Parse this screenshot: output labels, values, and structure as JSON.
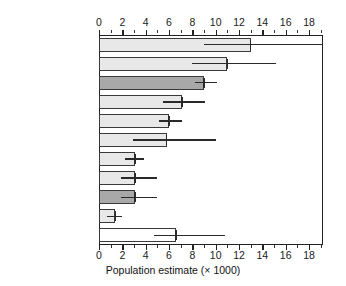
{
  "chart_data": {
    "type": "bar",
    "orientation": "horizontal",
    "title": "",
    "xlabel": "Population estimate (× 1000)",
    "ylabel": "",
    "xlim": [
      0,
      19.2
    ],
    "xticks": [
      0,
      2,
      4,
      6,
      8,
      10,
      12,
      14,
      16,
      18
    ],
    "xtick_labels": [
      "0",
      "2",
      "4",
      "6",
      "8",
      "10",
      "12",
      "14",
      "16",
      "18"
    ],
    "minor_tick_step": 1,
    "grid": false,
    "legend": null,
    "axis_top_duplicated": true,
    "categories": [
      "GERMANY",
      "POLAND",
      "CROATIA",
      "BELARUS",
      "HUNGARY",
      "ROMANIA",
      "SLOVAKIA",
      "GREECE",
      "ALBANIA",
      "CZECH REPUBLIC",
      "Other countries"
    ],
    "values": [
      13.0,
      11.0,
      9.0,
      7.1,
      6.0,
      5.8,
      3.1,
      3.1,
      3.1,
      1.4,
      6.6
    ],
    "error_low": [
      9.0,
      8.0,
      8.2,
      5.5,
      5.1,
      2.9,
      2.2,
      1.9,
      1.9,
      0.7,
      4.7
    ],
    "error_high": [
      19.2,
      15.2,
      10.1,
      9.1,
      7.1,
      10.0,
      3.9,
      5.0,
      5.0,
      2.0,
      10.8
    ],
    "error_high_clipped": [
      true,
      false,
      false,
      false,
      false,
      false,
      false,
      false,
      false,
      false,
      false
    ],
    "bar_fills": [
      "#e8e8e8",
      "#e8e8e8",
      "#a8a8a8",
      "#e8e8e8",
      "#e8e8e8",
      "#e8e8e8",
      "#e8e8e8",
      "#e8e8e8",
      "#a8a8a8",
      "#e8e8e8",
      "#ffffff"
    ],
    "bar_edge_color": "#3a3a3a",
    "error_color": "#2a2a2a",
    "axis_color": "#222222"
  }
}
